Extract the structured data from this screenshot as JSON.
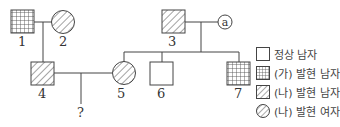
{
  "diagram": {
    "type": "pedigree",
    "individuals": [
      {
        "id": "1",
        "label": "1",
        "sex": "male",
        "phenotype": "(가) 발현"
      },
      {
        "id": "2",
        "label": "2",
        "sex": "female",
        "phenotype": "(나) 발현"
      },
      {
        "id": "3",
        "label": "3",
        "sex": "male",
        "phenotype": "(나) 발현"
      },
      {
        "id": "a",
        "label": "ⓐ",
        "sex": "unknown",
        "phenotype": "unknown"
      },
      {
        "id": "4",
        "label": "4",
        "sex": "male",
        "phenotype": "(나) 발현"
      },
      {
        "id": "5",
        "label": "5",
        "sex": "female",
        "phenotype": "(나) 발현"
      },
      {
        "id": "6",
        "label": "6",
        "sex": "male",
        "phenotype": "정상"
      },
      {
        "id": "7",
        "label": "7",
        "sex": "male",
        "phenotype": "(가) 발현"
      },
      {
        "id": "q",
        "label": "?",
        "sex": "unknown",
        "phenotype": "unknown"
      }
    ],
    "legend": [
      {
        "symbol": "square-empty",
        "label": "정상 남자"
      },
      {
        "symbol": "square-grid",
        "label": "(가) 발현 남자"
      },
      {
        "symbol": "square-hatch",
        "label": "(나) 발현 남자"
      },
      {
        "symbol": "circle-hatch",
        "label": "(나) 발현 여자"
      }
    ]
  }
}
